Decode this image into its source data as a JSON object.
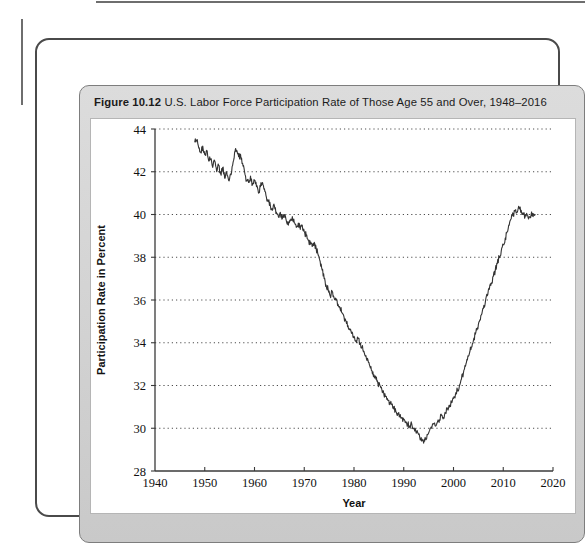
{
  "figure": {
    "number": "Figure 10.12",
    "caption": "U.S. Labor Force Participation Rate of Those Age 55 and Over, 1948–2016"
  },
  "chart_data": {
    "type": "line",
    "title": "U.S. Labor Force Participation Rate of Those Age 55 and Over, 1948–2016",
    "xlabel": "Year",
    "ylabel": "Participation Rate in Percent",
    "xlim": [
      1940,
      2020
    ],
    "ylim": [
      28,
      44
    ],
    "xticks": [
      1940,
      1950,
      1960,
      1970,
      1980,
      1990,
      2000,
      2010,
      2020
    ],
    "yticks": [
      28,
      30,
      32,
      34,
      36,
      38,
      40,
      42,
      44
    ],
    "grid": "horizontal-dotted",
    "legend": "none",
    "line_color": "#333333",
    "series": [
      {
        "name": "Participation Rate Age 55+",
        "x": [
          1948.0,
          1948.4,
          1948.8,
          1949.2,
          1949.6,
          1950.0,
          1950.4,
          1950.8,
          1951.2,
          1951.6,
          1952.0,
          1952.4,
          1952.8,
          1953.2,
          1953.6,
          1954.0,
          1954.4,
          1954.8,
          1955.2,
          1955.6,
          1956.0,
          1956.4,
          1956.8,
          1957.2,
          1957.6,
          1958.0,
          1958.4,
          1958.8,
          1959.2,
          1959.6,
          1960.0,
          1960.4,
          1960.8,
          1961.2,
          1961.6,
          1962.0,
          1962.4,
          1962.8,
          1963.2,
          1963.6,
          1964.0,
          1964.4,
          1964.8,
          1965.2,
          1965.6,
          1966.0,
          1966.4,
          1966.8,
          1967.2,
          1967.6,
          1968.0,
          1968.4,
          1968.8,
          1969.2,
          1969.6,
          1970.0,
          1970.4,
          1970.8,
          1971.2,
          1971.6,
          1972.0,
          1972.4,
          1972.8,
          1973.2,
          1973.6,
          1974.0,
          1974.4,
          1974.8,
          1975.2,
          1975.6,
          1976.0,
          1976.4,
          1976.8,
          1977.2,
          1977.6,
          1978.0,
          1978.4,
          1978.8,
          1979.2,
          1979.6,
          1980.0,
          1980.4,
          1980.8,
          1981.2,
          1981.6,
          1982.0,
          1982.4,
          1982.8,
          1983.2,
          1983.6,
          1984.0,
          1984.4,
          1984.8,
          1985.2,
          1985.6,
          1986.0,
          1986.4,
          1986.8,
          1987.2,
          1987.6,
          1988.0,
          1988.4,
          1988.8,
          1989.2,
          1989.6,
          1990.0,
          1990.4,
          1990.8,
          1991.2,
          1991.6,
          1992.0,
          1992.4,
          1992.8,
          1993.2,
          1993.6,
          1994.0,
          1994.4,
          1994.8,
          1995.2,
          1995.6,
          1996.0,
          1996.4,
          1996.8,
          1997.2,
          1997.6,
          1998.0,
          1998.4,
          1998.8,
          1999.2,
          1999.6,
          2000.0,
          2000.4,
          2000.8,
          2001.2,
          2001.6,
          2002.0,
          2002.4,
          2002.8,
          2003.2,
          2003.6,
          2004.0,
          2004.4,
          2004.8,
          2005.2,
          2005.6,
          2006.0,
          2006.4,
          2006.8,
          2007.2,
          2007.6,
          2008.0,
          2008.4,
          2008.8,
          2009.2,
          2009.6,
          2010.0,
          2010.4,
          2010.8,
          2011.2,
          2011.6,
          2012.0,
          2012.4,
          2012.8,
          2013.2,
          2013.6,
          2014.0,
          2014.4,
          2014.8,
          2015.2,
          2015.6,
          2016.0,
          2016.4
        ],
        "y": [
          43.4,
          43.5,
          43.1,
          42.9,
          43.2,
          42.8,
          43.0,
          42.5,
          42.6,
          42.2,
          42.5,
          42.0,
          42.3,
          41.9,
          42.2,
          41.7,
          42.0,
          41.6,
          41.9,
          42.3,
          42.9,
          43.0,
          42.7,
          42.8,
          42.4,
          42.0,
          41.6,
          41.5,
          41.8,
          41.4,
          41.6,
          41.3,
          41.0,
          41.3,
          41.5,
          41.2,
          40.8,
          40.6,
          40.4,
          40.2,
          40.4,
          40.1,
          39.9,
          40.1,
          39.8,
          40.0,
          39.7,
          39.5,
          39.7,
          39.9,
          39.6,
          39.4,
          39.6,
          39.3,
          39.5,
          39.2,
          39.0,
          38.8,
          38.6,
          38.5,
          38.7,
          38.4,
          38.1,
          37.8,
          37.4,
          37.0,
          36.7,
          36.5,
          36.2,
          36.4,
          36.1,
          36.0,
          35.8,
          35.6,
          35.4,
          35.2,
          35.0,
          34.8,
          34.6,
          34.5,
          34.3,
          34.1,
          34.2,
          34.0,
          33.8,
          33.6,
          33.4,
          33.2,
          32.9,
          32.7,
          32.5,
          32.3,
          32.1,
          32.0,
          31.8,
          31.6,
          31.5,
          31.3,
          31.2,
          31.1,
          30.9,
          30.8,
          30.7,
          30.6,
          30.5,
          30.4,
          30.3,
          30.2,
          30.1,
          30.2,
          30.0,
          29.9,
          29.8,
          29.6,
          29.4,
          29.3,
          29.5,
          29.7,
          29.9,
          30.0,
          30.2,
          30.1,
          30.3,
          30.4,
          30.6,
          30.5,
          30.7,
          30.9,
          31.0,
          31.2,
          31.4,
          31.6,
          31.8,
          32.0,
          32.3,
          32.6,
          32.9,
          33.2,
          33.5,
          33.8,
          34.1,
          34.4,
          34.7,
          35.0,
          35.3,
          35.6,
          35.9,
          36.2,
          36.5,
          36.8,
          37.1,
          37.4,
          37.7,
          38.0,
          38.3,
          38.6,
          38.9,
          39.2,
          39.5,
          39.8,
          40.0,
          40.2,
          40.1,
          40.3,
          40.2,
          40.0,
          39.9,
          40.0,
          39.9,
          40.0,
          39.9,
          40.0
        ]
      }
    ]
  },
  "axis": {
    "y_tick_labels": [
      "44",
      "42",
      "40",
      "38",
      "36",
      "34",
      "32",
      "30",
      "28"
    ],
    "x_tick_labels": [
      "1940",
      "1950",
      "1960",
      "1970",
      "1980",
      "1990",
      "2000",
      "2010",
      "2020"
    ],
    "x_title": "Year",
    "y_title": "Participation Rate in Percent"
  }
}
